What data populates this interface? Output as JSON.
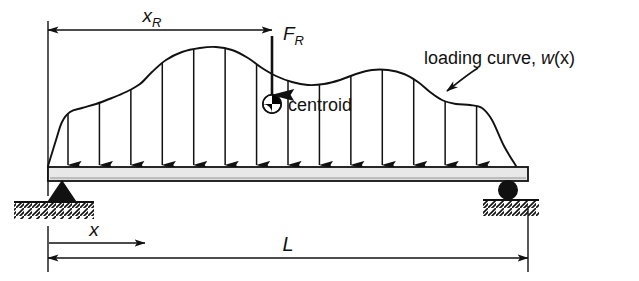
{
  "figure": {
    "type": "engineering-free-body-diagram",
    "canvas": {
      "width": 639,
      "height": 281
    },
    "colors": {
      "ink": "#111111",
      "beam_fill": "#e8e8e8",
      "background": "#ffffff",
      "centroid_dark": "#000000",
      "centroid_light": "#ffffff"
    },
    "labels": {
      "x_r": {
        "base": "x",
        "sub": "R"
      },
      "f_r": {
        "base": "F",
        "sub": "R"
      },
      "centroid": "centroid",
      "loading_curve": "loading curve, w(x)",
      "loading_curve_base": "loading curve, ",
      "loading_curve_fn_italic": "w",
      "loading_curve_fn_arg": "(x)",
      "length": "L",
      "x_axis": "x"
    },
    "dimensions": {
      "x_r_arrow": {
        "x_start": 48,
        "x_end": 272,
        "y": 30
      },
      "length_arrow": {
        "x_start": 48,
        "x_end": 528,
        "y": 258
      },
      "x_axis_arrow": {
        "x_start": 50,
        "x_end": 145,
        "y": 243
      }
    },
    "beam": {
      "x": 48,
      "y": 167,
      "width": 480,
      "height": 14,
      "note": "light gray filled rectangle with black outline"
    },
    "supports": {
      "left": {
        "kind": "pin",
        "shape": "filled-triangle",
        "x": 62,
        "y_top": 181,
        "ground_y": 202
      },
      "right": {
        "kind": "roller",
        "shape": "filled-circle",
        "cx": 508,
        "cy": 190,
        "r": 9,
        "ground_y": 200
      }
    },
    "resultant": {
      "label": "F_R",
      "arrow_x": 272,
      "arrow_y_top": 36,
      "arrow_y_tip": 95,
      "centroid_marker": {
        "cx": 272,
        "cy": 104,
        "r": 9
      }
    },
    "load_arrows": {
      "count": 15,
      "x_first": 68,
      "x_last": 508,
      "tip_y": 165,
      "note": "vertical lines from loading curve down to beam top, solid triangular heads"
    },
    "loading_curve": {
      "description": "irregular distributed load w(x): rises steeply from left support, plateau, rises to peak near x=210, dips, small secondary rise, then drops steeply to right support",
      "points": [
        [
          48,
          166
        ],
        [
          56,
          140
        ],
        [
          62,
          122
        ],
        [
          70,
          112
        ],
        [
          82,
          108
        ],
        [
          96,
          104
        ],
        [
          112,
          98
        ],
        [
          126,
          92
        ],
        [
          140,
          84
        ],
        [
          152,
          72
        ],
        [
          166,
          60
        ],
        [
          182,
          52
        ],
        [
          200,
          48
        ],
        [
          216,
          47
        ],
        [
          232,
          50
        ],
        [
          248,
          58
        ],
        [
          262,
          68
        ],
        [
          276,
          76
        ],
        [
          292,
          82
        ],
        [
          308,
          85
        ],
        [
          324,
          84
        ],
        [
          340,
          80
        ],
        [
          356,
          74
        ],
        [
          372,
          70
        ],
        [
          388,
          70
        ],
        [
          404,
          74
        ],
        [
          418,
          82
        ],
        [
          430,
          92
        ],
        [
          442,
          100
        ],
        [
          456,
          104
        ],
        [
          470,
          105
        ],
        [
          482,
          108
        ],
        [
          492,
          120
        ],
        [
          504,
          146
        ],
        [
          516,
          166
        ]
      ]
    },
    "annotation_arrow": {
      "from": [
        476,
        70
      ],
      "to": [
        444,
        92
      ],
      "note": "leader arrow from 'loading curve, w(x)' text to the curve"
    }
  }
}
